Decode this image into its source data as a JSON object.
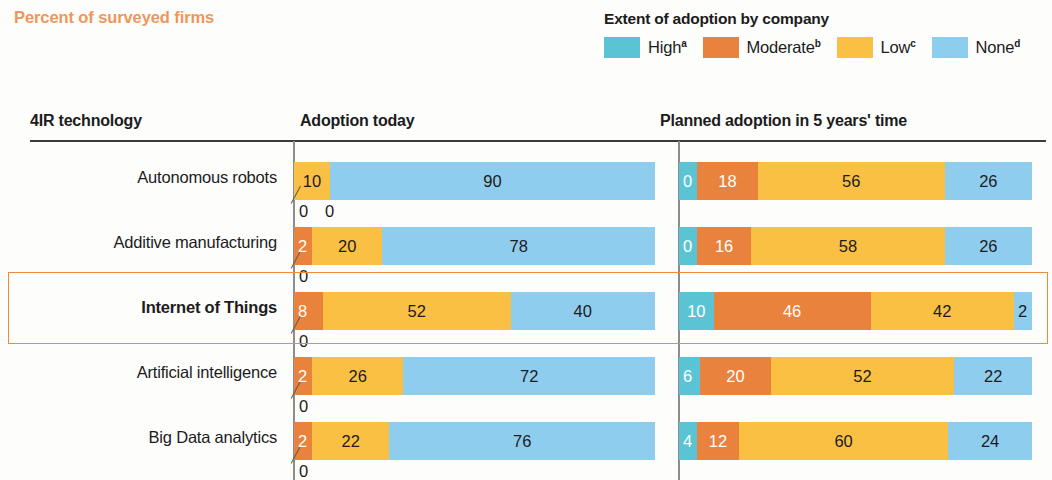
{
  "kicker": "Percent of surveyed firms",
  "legend": {
    "title": "Extent of adoption by company",
    "items": [
      {
        "label": "High",
        "note": "a",
        "color": "#5bc4d4"
      },
      {
        "label": "Moderate",
        "note": "b",
        "color": "#e8823c"
      },
      {
        "label": "Low",
        "note": "c",
        "color": "#fac043"
      },
      {
        "label": "None",
        "note": "d",
        "color": "#8fcdef"
      }
    ]
  },
  "columns": {
    "technology": "4IR technology",
    "today": "Adoption today",
    "future": "Planned adoption in 5 years' time"
  },
  "chart_data": {
    "type": "bar",
    "subtype": "100% stacked horizontal bar, two panels",
    "title": "Percent of surveyed firms",
    "xlabel": "",
    "ylabel": "4IR technology",
    "xlim": [
      0,
      100
    ],
    "grid": false,
    "legend_position": "top-right",
    "series": [
      {
        "name": "High",
        "note": "a",
        "color": "#5bc4d4"
      },
      {
        "name": "Moderate",
        "note": "b",
        "color": "#e8823c"
      },
      {
        "name": "Low",
        "note": "c",
        "color": "#fac043"
      },
      {
        "name": "None",
        "note": "d",
        "color": "#8fcdef"
      }
    ],
    "panels": [
      {
        "key": "today",
        "label": "Adoption today"
      },
      {
        "key": "future",
        "label": "Planned adoption in 5 years' time"
      }
    ],
    "categories": [
      "Autonomous robots",
      "Additive manufacturing",
      "Internet of Things",
      "Artificial intelligence",
      "Big Data analytics"
    ],
    "rows": [
      {
        "category": "Autonomous robots",
        "emphasis": false,
        "today": {
          "High": 0,
          "Moderate": 0,
          "Low": 10,
          "None": 90
        },
        "future": {
          "High": 0,
          "Moderate": 18,
          "Low": 56,
          "None": 26
        }
      },
      {
        "category": "Additive manufacturing",
        "emphasis": false,
        "today": {
          "High": 0,
          "Moderate": 2,
          "Low": 20,
          "None": 78
        },
        "future": {
          "High": 0,
          "Moderate": 16,
          "Low": 58,
          "None": 26
        }
      },
      {
        "category": "Internet of Things",
        "emphasis": true,
        "today": {
          "High": 0,
          "Moderate": 8,
          "Low": 52,
          "None": 40
        },
        "future": {
          "High": 10,
          "Moderate": 46,
          "Low": 42,
          "None": 2
        }
      },
      {
        "category": "Artificial intelligence",
        "emphasis": false,
        "today": {
          "High": 0,
          "Moderate": 2,
          "Low": 26,
          "None": 72
        },
        "future": {
          "High": 6,
          "Moderate": 20,
          "Low": 52,
          "None": 22
        }
      },
      {
        "category": "Big Data analytics",
        "emphasis": false,
        "today": {
          "High": 0,
          "Moderate": 2,
          "Low": 22,
          "None": 76
        },
        "future": {
          "High": 4,
          "Moderate": 12,
          "Low": 60,
          "None": 24
        }
      }
    ]
  }
}
